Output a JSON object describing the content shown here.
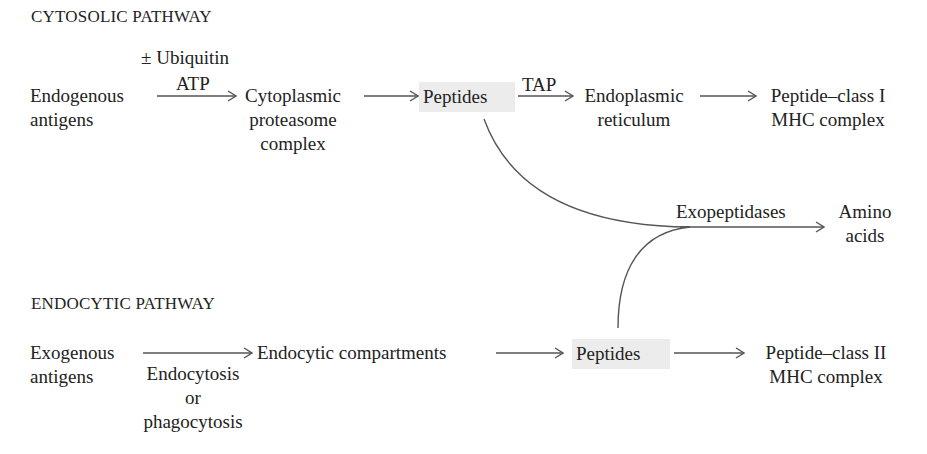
{
  "cytosolic": {
    "title": "CYTOSOLIC PATHWAY",
    "source": [
      "Endogenous",
      "antigens"
    ],
    "arrow1_label_top": "± Ubiquitin",
    "arrow1_label_mid": "ATP",
    "proteasome": [
      "Cytoplasmic",
      "proteasome",
      "complex"
    ],
    "peptides": "Peptides",
    "tap_label": "TAP",
    "er": [
      "Endoplasmic",
      "reticulum"
    ],
    "product": [
      "Peptide–class I",
      "MHC complex"
    ]
  },
  "degradation": {
    "enzyme": "Exopeptidases",
    "product": [
      "Amino",
      "acids"
    ]
  },
  "endocytic": {
    "title": "ENDOCYTIC PATHWAY",
    "source": [
      "Exogenous",
      "antigens"
    ],
    "arrow_label": [
      "Endocytosis",
      "or",
      "phagocytosis"
    ],
    "compartments": "Endocytic compartments",
    "peptides": "Peptides",
    "product": [
      "Peptide–class II",
      "MHC complex"
    ]
  },
  "colors": {
    "text": "#222222",
    "arrow": "#555555",
    "highlight": "#ececec"
  }
}
